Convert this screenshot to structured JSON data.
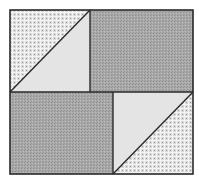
{
  "diagram": {
    "type": "quilt-block",
    "colors": {
      "background": "#ffffff",
      "outline": "#2a2a2a",
      "dark_fill": "#a9a9a9",
      "dark_noise": "#8c8c8c",
      "check_base": "#d9d9d9",
      "check_line": "#f4f4f4",
      "check_dot": "#9a9a9a",
      "light_fill": "#e4e4e4"
    },
    "outer": {
      "x": 10,
      "y": 10,
      "w": 183,
      "h": 164
    },
    "pieces": [
      {
        "name": "top-left-checked-triangle",
        "fill": "checked",
        "points": "10,10 90,10 10,92"
      },
      {
        "name": "top-left-light-triangle",
        "fill": "light",
        "points": "90,10 90,92 10,92"
      },
      {
        "name": "top-right-dark-rectangle",
        "fill": "dark",
        "points": "90,10 193,10 193,92 90,92"
      },
      {
        "name": "bottom-left-dark-rectangle",
        "fill": "dark",
        "points": "10,92 113,92 113,174 10,174"
      },
      {
        "name": "bottom-right-light-triangle",
        "fill": "light",
        "points": "113,92 193,92 113,174"
      },
      {
        "name": "bottom-right-checked-triangle",
        "fill": "checked",
        "points": "193,92 193,174 113,174"
      }
    ],
    "lines": [
      {
        "name": "horizontal-divider",
        "x1": 10,
        "y1": 92,
        "x2": 193,
        "y2": 92
      },
      {
        "name": "top-vertical-divider",
        "x1": 90,
        "y1": 10,
        "x2": 90,
        "y2": 92
      },
      {
        "name": "bottom-vertical-divider",
        "x1": 113,
        "y1": 92,
        "x2": 113,
        "y2": 174
      },
      {
        "name": "top-left-diagonal",
        "x1": 10,
        "y1": 92,
        "x2": 90,
        "y2": 10
      },
      {
        "name": "bottom-right-diagonal",
        "x1": 113,
        "y1": 174,
        "x2": 193,
        "y2": 92
      }
    ]
  }
}
